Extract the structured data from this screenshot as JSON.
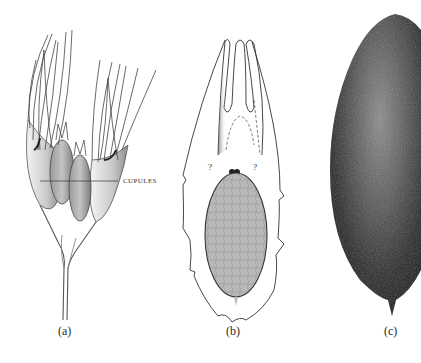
{
  "figure": {
    "panels": [
      {
        "id": "a",
        "label": "(a)",
        "kind": "botanical-illustration",
        "subject": "branching axis with cupules bearing long recurved lobes",
        "callout": "CUPULES"
      },
      {
        "id": "b",
        "label": "(b)",
        "kind": "schematic-section",
        "subject": "cupule section with enclosed ovule; three apical lobes",
        "unknown_marks": [
          "?",
          "?"
        ]
      },
      {
        "id": "c",
        "label": "(c)",
        "kind": "photograph",
        "subject": "dark ovoid seed with pointed basal tip"
      }
    ],
    "colors": {
      "background": "#ffffff",
      "ink": "#2a2a2a",
      "ovule_fill": "#b4b4b4",
      "seed_dark": "#1a1a1a",
      "seed_light": "#8a8a8a"
    }
  }
}
